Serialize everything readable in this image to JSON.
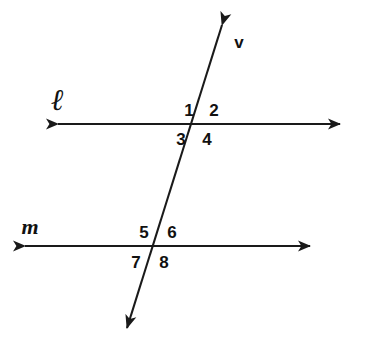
{
  "figure": {
    "type": "geometry-diagram",
    "background_color": "#ffffff",
    "stroke_color": "#1a1a1a"
  },
  "lines": [
    {
      "id": "line-l",
      "label": "ℓ",
      "label_x": 57,
      "label_y": 100,
      "kind": "horizontal",
      "x1": 58,
      "y1": 124,
      "x2": 340,
      "y2": 124,
      "arrow_start": true,
      "arrow_end": true
    },
    {
      "id": "line-m",
      "label": "m",
      "label_x": 30,
      "label_y": 227,
      "kind": "horizontal",
      "x1": 25,
      "y1": 246,
      "x2": 310,
      "y2": 246,
      "arrow_start": true,
      "arrow_end": true
    },
    {
      "id": "transversal-v",
      "label": "v",
      "label_x": 239,
      "label_y": 42,
      "kind": "transversal",
      "x1": 222,
      "y1": 25,
      "x2": 127,
      "y2": 328,
      "arrow_start": true,
      "arrow_end": true
    }
  ],
  "intersections": [
    {
      "id": "intersection-l-v",
      "x": 196,
      "y": 124
    },
    {
      "id": "intersection-m-v",
      "x": 153,
      "y": 246
    }
  ],
  "angles": [
    {
      "id": "angle-1",
      "label": "1",
      "x": 189,
      "y": 110,
      "at": "intersection-l-v",
      "position": "upper-left"
    },
    {
      "id": "angle-2",
      "label": "2",
      "x": 214,
      "y": 110,
      "at": "intersection-l-v",
      "position": "upper-right"
    },
    {
      "id": "angle-3",
      "label": "3",
      "x": 181,
      "y": 139,
      "at": "intersection-l-v",
      "position": "lower-left"
    },
    {
      "id": "angle-4",
      "label": "4",
      "x": 207,
      "y": 139,
      "at": "intersection-l-v",
      "position": "lower-right"
    },
    {
      "id": "angle-5",
      "label": "5",
      "x": 144,
      "y": 232,
      "at": "intersection-m-v",
      "position": "upper-left"
    },
    {
      "id": "angle-6",
      "label": "6",
      "x": 172,
      "y": 232,
      "at": "intersection-m-v",
      "position": "upper-right"
    },
    {
      "id": "angle-7",
      "label": "7",
      "x": 136,
      "y": 262,
      "at": "intersection-m-v",
      "position": "lower-left"
    },
    {
      "id": "angle-8",
      "label": "8",
      "x": 164,
      "y": 262,
      "at": "intersection-m-v",
      "position": "lower-right"
    }
  ]
}
